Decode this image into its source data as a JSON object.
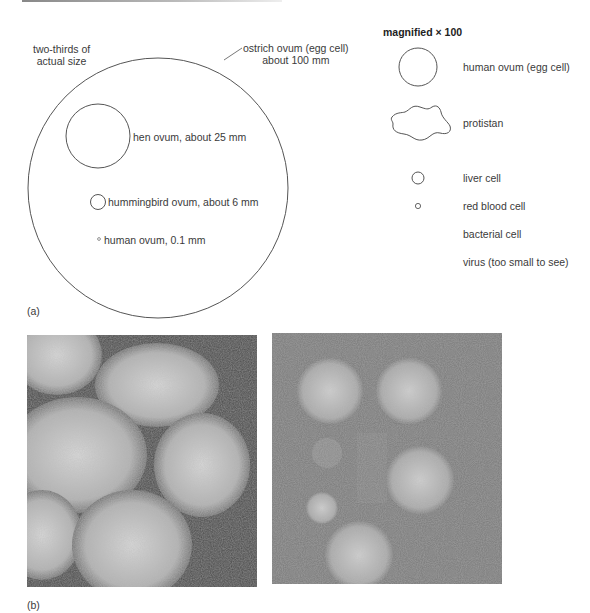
{
  "figure": {
    "panel_a": {
      "label": "(a)",
      "scale_note_line1": "two-thirds of",
      "scale_note_line2": "actual size",
      "ostrich_line1": "ostrich ovum (egg cell)",
      "ostrich_line2": "about 100 mm",
      "hen": "hen ovum, about 25 mm",
      "hummingbird": "hummingbird ovum, about 6 mm",
      "human_small": "human ovum, 0.1 mm",
      "magnified_title": "magnified",
      "magnified_factor": "× 100",
      "magnified_items": [
        {
          "label": "human ovum (egg cell)",
          "shape": "circle-large"
        },
        {
          "label": "protistan",
          "shape": "blob"
        },
        {
          "label": "liver cell",
          "shape": "circle-small"
        },
        {
          "label": "red blood cell",
          "shape": "circle-tiny"
        },
        {
          "label": "bacterial cell",
          "shape": "none"
        },
        {
          "label": "virus (too small to see)",
          "shape": "none"
        }
      ]
    },
    "panel_b": {
      "label": "(b)",
      "images": [
        {
          "description": "electron micrograph of large virus-like particles, densely packed"
        },
        {
          "description": "electron micrograph of spherical virus particles on gray background"
        }
      ]
    }
  }
}
